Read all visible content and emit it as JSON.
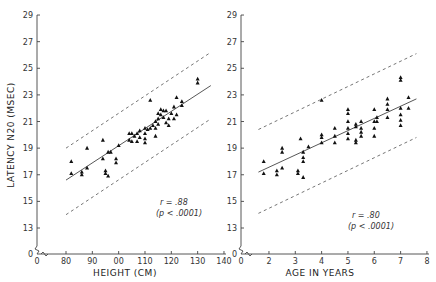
{
  "chart_data": [
    {
      "type": "scatter",
      "id": "height",
      "xlabel": "HEIGHT (CM)",
      "ylabel": "LATENCY N20 (MSEC)",
      "x_ticks": [
        0,
        80,
        90,
        100,
        110,
        120,
        130,
        140
      ],
      "x_tick_labels": [
        "0",
        "80",
        "90",
        "00",
        "110",
        "120",
        "130",
        "140"
      ],
      "y_ticks": [
        0,
        13,
        15,
        17,
        19,
        21,
        23,
        25,
        27,
        29
      ],
      "xlim": [
        80,
        140
      ],
      "ylim": [
        13,
        29
      ],
      "axis_break": true,
      "annotation": [
        "r = .88",
        "(p < .0001)"
      ],
      "regression_line": [
        [
          80,
          16.6
        ],
        [
          135,
          23.7
        ]
      ],
      "upper_bound": [
        [
          80,
          19.0
        ],
        [
          135,
          26.2
        ]
      ],
      "lower_bound": [
        [
          80,
          14.0
        ],
        [
          135,
          21.2
        ]
      ],
      "points": [
        [
          82,
          18.0
        ],
        [
          82,
          17.1
        ],
        [
          86,
          17.2
        ],
        [
          86,
          17.0
        ],
        [
          88,
          19.0
        ],
        [
          88,
          17.5
        ],
        [
          94,
          19.6
        ],
        [
          94,
          18.2
        ],
        [
          95,
          17.3
        ],
        [
          95,
          17.1
        ],
        [
          96,
          18.7
        ],
        [
          96,
          16.9
        ],
        [
          97,
          18.7
        ],
        [
          99,
          18.2
        ],
        [
          99,
          17.9
        ],
        [
          100,
          19.2
        ],
        [
          104,
          20.1
        ],
        [
          104,
          19.6
        ],
        [
          105,
          20.1
        ],
        [
          105,
          19.5
        ],
        [
          106,
          19.9
        ],
        [
          107,
          20.1
        ],
        [
          107,
          19.5
        ],
        [
          108,
          20.3
        ],
        [
          108,
          19.8
        ],
        [
          110,
          20.5
        ],
        [
          110,
          20.1
        ],
        [
          110,
          19.7
        ],
        [
          110,
          19.4
        ],
        [
          111,
          20.4
        ],
        [
          112,
          22.6
        ],
        [
          112,
          20.5
        ],
        [
          113,
          20.7
        ],
        [
          114,
          21.0
        ],
        [
          114,
          20.5
        ],
        [
          114,
          19.9
        ],
        [
          115,
          21.6
        ],
        [
          115,
          21.2
        ],
        [
          115,
          20.8
        ],
        [
          116,
          21.9
        ],
        [
          116,
          21.5
        ],
        [
          117,
          21.8
        ],
        [
          117,
          21.3
        ],
        [
          118,
          21.8
        ],
        [
          118,
          20.9
        ],
        [
          119,
          21.2
        ],
        [
          119,
          20.7
        ],
        [
          120,
          21.6
        ],
        [
          121,
          22.1
        ],
        [
          121,
          21.2
        ],
        [
          122,
          22.8
        ],
        [
          122,
          21.5
        ],
        [
          124,
          22.5
        ],
        [
          124,
          22.2
        ],
        [
          130,
          24.2
        ],
        [
          130,
          23.9
        ]
      ]
    },
    {
      "type": "scatter",
      "id": "age",
      "xlabel": "AGE IN YEARS",
      "ylabel": "LATENCY N20 (MSEC)",
      "x_ticks": [
        0,
        2,
        3,
        4,
        5,
        6,
        7,
        8
      ],
      "x_tick_labels": [
        "0",
        "2",
        "3",
        "4",
        "5",
        "6",
        "7",
        "8"
      ],
      "y_ticks": [
        0,
        13,
        15,
        17,
        19,
        21,
        23,
        25,
        27,
        29
      ],
      "xlim": [
        1,
        8
      ],
      "ylim": [
        13,
        29
      ],
      "axis_break": true,
      "annotation": [
        "r = .80",
        "(p < .0001)"
      ],
      "regression_line": [
        [
          1.6,
          17.2
        ],
        [
          7.6,
          22.7
        ]
      ],
      "upper_bound": [
        [
          1.6,
          20.4
        ],
        [
          7.6,
          26.1
        ]
      ],
      "lower_bound": [
        [
          1.6,
          14.1
        ],
        [
          7.6,
          19.8
        ]
      ],
      "points": [
        [
          1.8,
          18.0
        ],
        [
          1.8,
          17.1
        ],
        [
          2.3,
          17.3
        ],
        [
          2.3,
          17.0
        ],
        [
          2.5,
          19.0
        ],
        [
          2.5,
          18.7
        ],
        [
          2.5,
          17.5
        ],
        [
          3.1,
          17.3
        ],
        [
          3.1,
          17.1
        ],
        [
          3.2,
          19.7
        ],
        [
          3.3,
          18.3
        ],
        [
          3.3,
          18.0
        ],
        [
          3.3,
          18.7
        ],
        [
          3.3,
          16.8
        ],
        [
          3.5,
          19.1
        ],
        [
          4.0,
          20.0
        ],
        [
          4.0,
          19.8
        ],
        [
          4.0,
          19.4
        ],
        [
          4.0,
          22.6
        ],
        [
          4.5,
          20.5
        ],
        [
          4.5,
          19.9
        ],
        [
          4.5,
          19.4
        ],
        [
          5.0,
          21.9
        ],
        [
          5.0,
          21.6
        ],
        [
          5.0,
          21.0
        ],
        [
          5.0,
          20.5
        ],
        [
          5.0,
          20.1
        ],
        [
          5.0,
          19.7
        ],
        [
          5.3,
          20.8
        ],
        [
          5.3,
          20.6
        ],
        [
          5.3,
          19.6
        ],
        [
          5.3,
          19.4
        ],
        [
          5.5,
          21.0
        ],
        [
          5.5,
          20.5
        ],
        [
          5.5,
          20.2
        ],
        [
          5.5,
          19.9
        ],
        [
          6.0,
          21.9
        ],
        [
          6.0,
          21.0
        ],
        [
          6.0,
          20.5
        ],
        [
          6.0,
          19.9
        ],
        [
          6.1,
          21.3
        ],
        [
          6.1,
          21.0
        ],
        [
          6.5,
          22.7
        ],
        [
          6.5,
          22.3
        ],
        [
          6.5,
          21.9
        ],
        [
          6.5,
          21.3
        ],
        [
          7.0,
          24.3
        ],
        [
          7.0,
          24.1
        ],
        [
          7.0,
          22.0
        ],
        [
          7.0,
          21.5
        ],
        [
          7.0,
          21.1
        ],
        [
          7.0,
          20.7
        ],
        [
          7.3,
          22.8
        ],
        [
          7.3,
          22.0
        ]
      ]
    }
  ]
}
